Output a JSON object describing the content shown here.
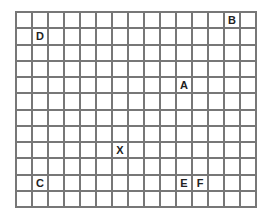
{
  "grid": {
    "columns": 15,
    "rows": 12
  },
  "labels": [
    {
      "letter": "B",
      "col": 13,
      "row": 0
    },
    {
      "letter": "D",
      "col": 1,
      "row": 1
    },
    {
      "letter": "A",
      "col": 10,
      "row": 4
    },
    {
      "letter": "X",
      "col": 6,
      "row": 8
    },
    {
      "letter": "C",
      "col": 1,
      "row": 10
    },
    {
      "letter": "E",
      "col": 10,
      "row": 10
    },
    {
      "letter": "F",
      "col": 11,
      "row": 10
    }
  ]
}
